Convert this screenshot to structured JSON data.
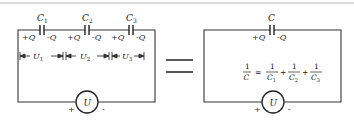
{
  "series_circuit": {
    "capacitors": [
      {
        "name": "C",
        "sub": "1",
        "left_charge": "+Q",
        "right_charge": "-Q",
        "voltage": "U",
        "voltage_sub": "1"
      },
      {
        "name": "C",
        "sub": "2",
        "left_charge": "+Q",
        "right_charge": "-Q",
        "voltage": "U",
        "voltage_sub": "2"
      },
      {
        "name": "C",
        "sub": "3",
        "left_charge": "+Q",
        "right_charge": "-Q",
        "voltage": "U",
        "voltage_sub": "3"
      }
    ],
    "source": {
      "label": "U",
      "plus": "+",
      "minus": "-"
    }
  },
  "equals": "=",
  "equivalent_circuit": {
    "capacitor": {
      "name": "C",
      "left_charge": "+Q",
      "right_charge": "-Q"
    },
    "formula": {
      "lhs_num": "1",
      "lhs_den": "C",
      "eq": "=",
      "terms": [
        {
          "num": "1",
          "den": "C",
          "sub": "1"
        },
        {
          "num": "1",
          "den": "C",
          "sub": "2"
        },
        {
          "num": "1",
          "den": "C",
          "sub": "3"
        }
      ],
      "plus": "+"
    },
    "source": {
      "label": "U",
      "plus": "+",
      "minus": "-"
    }
  },
  "colors": {
    "line": "#333333",
    "text": "#222222",
    "top_rule": "#b0b0b0"
  }
}
